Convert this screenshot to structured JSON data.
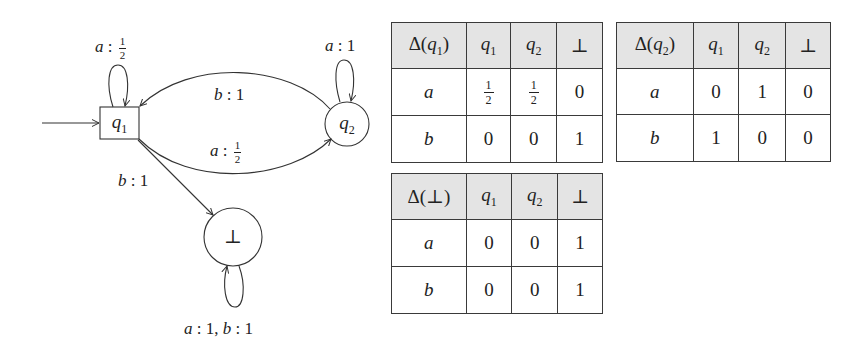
{
  "automaton": {
    "states": [
      {
        "id": "q1",
        "label": "q",
        "sub": "1",
        "shape": "rectangle",
        "initial": true
      },
      {
        "id": "q2",
        "label": "q",
        "sub": "2",
        "shape": "circle"
      },
      {
        "id": "bot",
        "label": "⊥",
        "shape": "circle"
      }
    ],
    "edges": {
      "q1_self": {
        "sym": "a",
        "sep": " : ",
        "num": "1",
        "den": "2"
      },
      "q2_self": {
        "sym": "a",
        "sep": " : ",
        "val": "1"
      },
      "q2_to_q1": {
        "sym": "b",
        "sep": " : ",
        "val": "1"
      },
      "q1_to_q2": {
        "sym": "a",
        "sep": " : ",
        "num": "1",
        "den": "2"
      },
      "q1_to_bot": {
        "sym": "b",
        "sep": " : ",
        "val": "1"
      },
      "bot_self": {
        "sym1": "a",
        "val1": " : 1, ",
        "sym2": "b",
        "val2": " : 1"
      }
    }
  },
  "tables": [
    {
      "title_prefix": "Δ(",
      "title_sym": "q",
      "title_sub": "1",
      "title_suffix": ")",
      "headers": [
        {
          "sym": "q",
          "sub": "1"
        },
        {
          "sym": "q",
          "sub": "2"
        },
        {
          "sym": "⊥"
        }
      ],
      "rows": [
        {
          "symbol": "a",
          "cells": [
            {
              "num": "1",
              "den": "2"
            },
            {
              "num": "1",
              "den": "2"
            },
            {
              "val": "0"
            }
          ]
        },
        {
          "symbol": "b",
          "cells": [
            {
              "val": "0"
            },
            {
              "val": "0"
            },
            {
              "val": "1"
            }
          ]
        }
      ]
    },
    {
      "title_prefix": "Δ(",
      "title_sym": "q",
      "title_sub": "2",
      "title_suffix": ")",
      "headers": [
        {
          "sym": "q",
          "sub": "1"
        },
        {
          "sym": "q",
          "sub": "2"
        },
        {
          "sym": "⊥"
        }
      ],
      "rows": [
        {
          "symbol": "a",
          "cells": [
            {
              "val": "0"
            },
            {
              "val": "1"
            },
            {
              "val": "0"
            }
          ]
        },
        {
          "symbol": "b",
          "cells": [
            {
              "val": "1"
            },
            {
              "val": "0"
            },
            {
              "val": "0"
            }
          ]
        }
      ]
    },
    {
      "title_prefix": "Δ(",
      "title_sym": "⊥",
      "title_sub": "",
      "title_suffix": ")",
      "headers": [
        {
          "sym": "q",
          "sub": "1"
        },
        {
          "sym": "q",
          "sub": "2"
        },
        {
          "sym": "⊥"
        }
      ],
      "rows": [
        {
          "symbol": "a",
          "cells": [
            {
              "val": "0"
            },
            {
              "val": "0"
            },
            {
              "val": "1"
            }
          ]
        },
        {
          "symbol": "b",
          "cells": [
            {
              "val": "0"
            },
            {
              "val": "0"
            },
            {
              "val": "1"
            }
          ]
        }
      ]
    }
  ],
  "colors": {
    "header_fill": "#e4e4e4",
    "line": "#3a3a3a",
    "background": "#ffffff"
  }
}
